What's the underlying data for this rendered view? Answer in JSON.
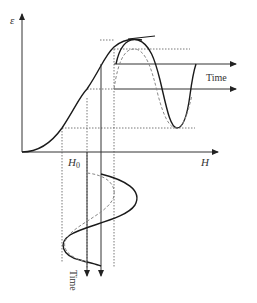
{
  "diagram": {
    "type": "magnetostriction-curve-with-ac-excitation",
    "labels": {
      "y_axis": "ε",
      "x_axis": "H",
      "bias_field": "H",
      "bias_field_sub": "0",
      "time_horizontal": "Time",
      "time_vertical": "Time"
    },
    "colors": {
      "curve": "#1a1a1a",
      "dashed_curve": "#888888",
      "guide": "#555555",
      "axis": "#333333"
    },
    "elements": [
      "sigmoid strain-vs-field curve",
      "tangent line at curve peak",
      "solid and dashed strain response waveforms vs time (right)",
      "solid and dashed field excitation waveforms vs time (bottom)",
      "dotted projection guide lines"
    ]
  }
}
